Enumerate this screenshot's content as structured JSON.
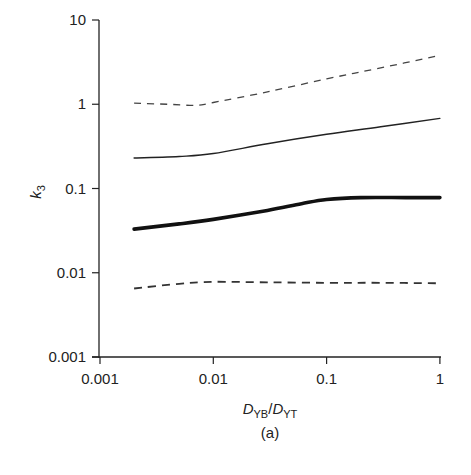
{
  "chart_data": {
    "type": "line",
    "title": "",
    "caption": "(a)",
    "xlabel": "D_YB/D_YT",
    "xlabel_parts": {
      "main1": "D",
      "sub1": "YB",
      "slash": "/",
      "main2": "D",
      "sub2": "YT"
    },
    "ylabel": "k3",
    "ylabel_parts": {
      "main": "k",
      "sub": "3"
    },
    "xscale": "log",
    "yscale": "log",
    "xlim": [
      0.001,
      1
    ],
    "ylim": [
      0.001,
      10
    ],
    "xticks": [
      "0.001",
      "0.01",
      "0.1",
      "1"
    ],
    "yticks": [
      "0.001",
      "0.01",
      "0.1",
      "1",
      "10"
    ],
    "grid": false,
    "legend": null,
    "series": [
      {
        "name": "upper dashed",
        "style": "dashed-thin",
        "x": [
          0.002,
          0.004,
          0.007,
          0.01,
          0.03,
          0.1,
          0.3,
          1
        ],
        "y": [
          1.03,
          1.0,
          0.97,
          1.05,
          1.4,
          2.0,
          2.7,
          3.8
        ]
      },
      {
        "name": "thin solid",
        "style": "solid-thin",
        "x": [
          0.002,
          0.005,
          0.01,
          0.03,
          0.1,
          0.3,
          1
        ],
        "y": [
          0.23,
          0.24,
          0.26,
          0.34,
          0.44,
          0.54,
          0.68
        ]
      },
      {
        "name": "thick solid",
        "style": "solid-thick",
        "x": [
          0.002,
          0.005,
          0.01,
          0.03,
          0.06,
          0.1,
          0.2,
          0.5,
          1
        ],
        "y": [
          0.033,
          0.038,
          0.043,
          0.055,
          0.066,
          0.074,
          0.078,
          0.078,
          0.078
        ]
      },
      {
        "name": "lower dashed",
        "style": "dashed-thick",
        "x": [
          0.002,
          0.005,
          0.01,
          0.03,
          0.1,
          0.3,
          1
        ],
        "y": [
          0.0065,
          0.0074,
          0.0078,
          0.0077,
          0.0076,
          0.0076,
          0.0075
        ]
      }
    ]
  }
}
